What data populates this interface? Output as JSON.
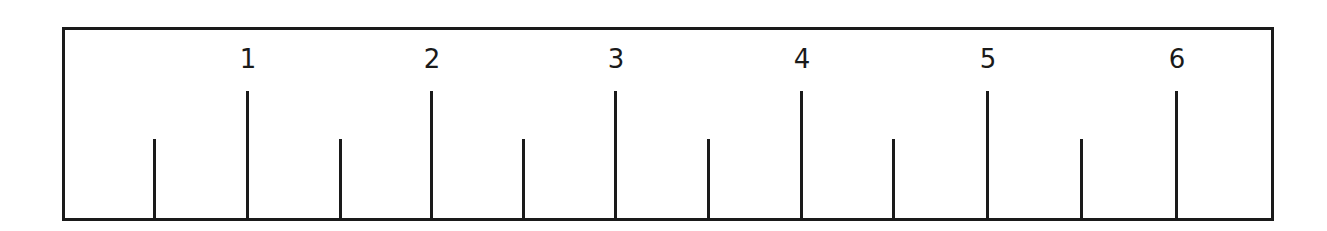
{
  "ruler": {
    "unit_labels": [
      "1",
      "2",
      "3",
      "4",
      "5",
      "6"
    ],
    "major_ticks": [
      {
        "label": "1",
        "x": 248
      },
      {
        "label": "2",
        "x": 432
      },
      {
        "label": "3",
        "x": 616
      },
      {
        "label": "4",
        "x": 802
      },
      {
        "label": "5",
        "x": 988
      },
      {
        "label": "6",
        "x": 1177
      }
    ],
    "minor_ticks": [
      {
        "value": 0.5,
        "x": 155
      },
      {
        "value": 1.5,
        "x": 341
      },
      {
        "value": 2.5,
        "x": 524
      },
      {
        "value": 3.5,
        "x": 709
      },
      {
        "value": 4.5,
        "x": 894
      },
      {
        "value": 5.5,
        "x": 1082
      }
    ],
    "colors": {
      "line": "#1a1a1a",
      "background": "#ffffff"
    }
  }
}
